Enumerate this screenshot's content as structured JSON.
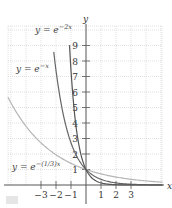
{
  "chart_data": {
    "type": "line",
    "title": "",
    "xlabel": "x",
    "ylabel": "y",
    "xlim": [
      -5.2,
      5.1
    ],
    "ylim": [
      0,
      10
    ],
    "grid": true,
    "x_ticks": [
      -3,
      -2,
      -1,
      1,
      2,
      3
    ],
    "x_tick_labels": [
      "−3",
      "−2",
      "−1",
      "1",
      "2",
      "3"
    ],
    "y_ticks": [
      1,
      2,
      3,
      4,
      5,
      6,
      7,
      8,
      9
    ],
    "y_tick_labels": [
      "1",
      "2",
      "3",
      "4",
      "5",
      "6",
      "7",
      "8",
      "9"
    ],
    "series": [
      {
        "name": "y = e^{-2x}",
        "label_main": "y = e",
        "label_sup": "−2x",
        "color": "#555555",
        "k": 2,
        "x_range": [
          -1.1,
          5.1
        ]
      },
      {
        "name": "y = e^{-x}",
        "label_main": "y = e",
        "label_sup": "−x",
        "color": "#666666",
        "k": 1,
        "x_range": [
          -2.15,
          5.1
        ]
      },
      {
        "name": "y = e^{-(1/3)x}",
        "label_main": "y = e",
        "label_sup": "−(1/3)x",
        "color": "#b5b5b5",
        "k": 0.3333,
        "x_range": [
          -5.2,
          5.1
        ]
      }
    ],
    "annotations": [
      {
        "text": "y = e^{-2x}",
        "near": [
          -1.4,
          9.6
        ]
      },
      {
        "text": "y = e^{-x}",
        "near": [
          -4.0,
          7.5
        ]
      },
      {
        "text": "y = e^{-(1/3)x}",
        "near": [
          -5.1,
          1.2
        ]
      }
    ]
  },
  "axes": {
    "x_label": "x",
    "y_label": "y"
  },
  "labels": {
    "e2x_main": "y = e",
    "e2x_sup": "−2x",
    "ex_main": "y = e",
    "ex_sup": "−x",
    "e13x_main": "y = e",
    "e13x_sup": "−(1/3)x"
  }
}
